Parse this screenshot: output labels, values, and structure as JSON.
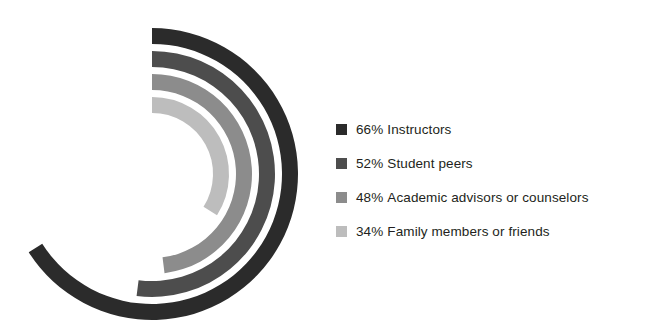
{
  "chart_data": {
    "type": "bar",
    "chart_subtype": "radial-bar",
    "title": "",
    "subtitle": "",
    "xlabel": "",
    "ylabel": "",
    "grid": false,
    "legend_position": "right",
    "value_unit": "%",
    "value_max": 100,
    "axis_start_angle_deg": -90,
    "axis_direction": "clockwise",
    "categories": [
      "Instructors",
      "Student peers",
      "Academic advisors or counselors",
      "Family members or friends"
    ],
    "values": [
      66,
      52,
      48,
      34
    ],
    "value_labels": [
      "66%",
      "52%",
      "48%",
      "34%"
    ],
    "colors": [
      "#2b2b2b",
      "#4d4d4d",
      "#8c8c8c",
      "#bdbdbd"
    ],
    "series": [
      {
        "name": "Share of students",
        "values": [
          66,
          52,
          48,
          34
        ]
      }
    ],
    "points": [
      {
        "category": "Instructors",
        "value": 66,
        "label": "66%",
        "color": "#2b2b2b",
        "ring": 1,
        "sweep_deg": 237.6
      },
      {
        "category": "Student peers",
        "value": 52,
        "label": "52%",
        "color": "#4d4d4d",
        "ring": 2,
        "sweep_deg": 187.2
      },
      {
        "category": "Academic advisors or counselors",
        "value": 48,
        "label": "48%",
        "color": "#8c8c8c",
        "ring": 3,
        "sweep_deg": 172.8
      },
      {
        "category": "Family members or friends",
        "value": 34,
        "label": "34%",
        "color": "#bdbdbd",
        "ring": 4,
        "sweep_deg": 122.4
      }
    ]
  },
  "legend": {
    "items": [
      {
        "value_label": "66%",
        "label": "Instructors",
        "color": "#2b2b2b"
      },
      {
        "value_label": "52%",
        "label": "Student peers",
        "color": "#4d4d4d"
      },
      {
        "value_label": "48%",
        "label": "Academic advisors or counselors",
        "color": "#8c8c8c"
      },
      {
        "value_label": "34%",
        "label": "Family members or friends",
        "color": "#bdbdbd"
      }
    ]
  },
  "geometry": {
    "center_x": 152,
    "center_y": 174,
    "outer_radius": 146,
    "band_thickness": 16,
    "band_gap": 7
  },
  "background_color": "#ffffff",
  "text_color": "#231f20"
}
